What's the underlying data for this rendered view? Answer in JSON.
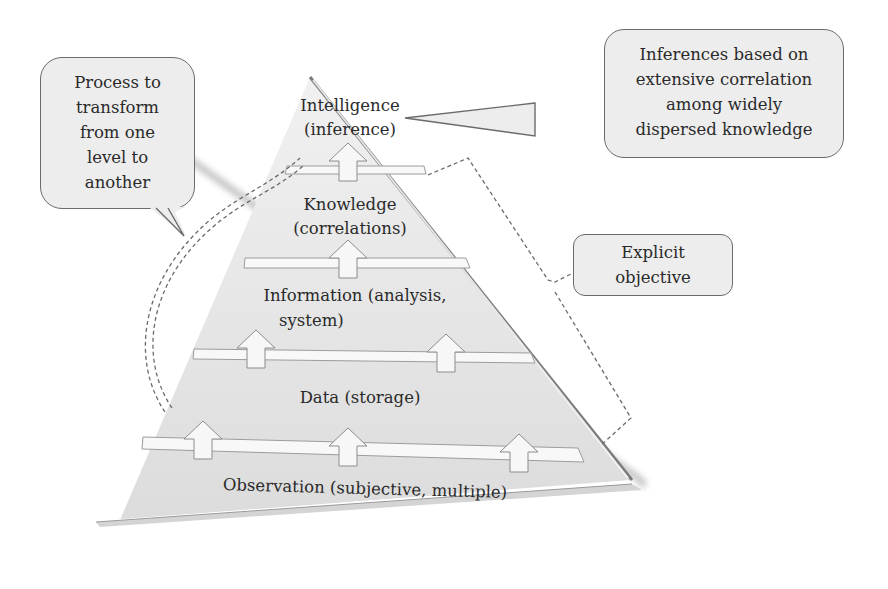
{
  "pyramid": {
    "levels": [
      {
        "name": "Intelligence",
        "sub": "(inference)"
      },
      {
        "name": "Knowledge",
        "sub": "(correlations)"
      },
      {
        "name": "Information (analysis,",
        "sub": "system)"
      },
      {
        "name": "Data (storage)"
      },
      {
        "name": "Observation (subjective, multiple)"
      }
    ],
    "colors": {
      "fill": "#e6e6e6",
      "edge": "#8a8a8a",
      "callout_fill": "#ededed",
      "callout_border": "#6b6b6b",
      "dash": "#6b6b6b"
    }
  },
  "callouts": {
    "process": [
      "Process to",
      "transform",
      "from one",
      "level to",
      "another"
    ],
    "inferences": [
      "Inferences based on",
      "extensive correlation",
      "among widely",
      "dispersed knowledge"
    ],
    "explicit": [
      "Explicit",
      "objective"
    ]
  }
}
